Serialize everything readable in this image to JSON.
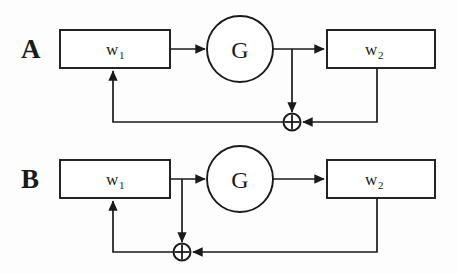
{
  "figure": {
    "background_color": "#fdfdfd",
    "line_color": "#1a1a1a",
    "fill_color": "#ffffff"
  },
  "panels": [
    {
      "id": "A",
      "label": "A",
      "description": "Error signal tapped from the output of the gain block G",
      "blocks": [
        {
          "id": "w1",
          "label": "w",
          "subscript": "1",
          "shape": "rectangle"
        },
        {
          "id": "G",
          "label": "G",
          "subscript": "",
          "shape": "circle"
        },
        {
          "id": "w2",
          "label": "w",
          "subscript": "2",
          "shape": "rectangle"
        }
      ],
      "junction": {
        "id": "sum-a",
        "symbol": "+",
        "shape": "circle-plus"
      },
      "signal_path": [
        "w1 -> G",
        "G -> w2",
        "G -> sum-a (downward tap)",
        "w2 -> sum-a (right feedback)",
        "sum-a -> w1 (left feedback)"
      ]
    },
    {
      "id": "B",
      "label": "B",
      "description": "Error signal tapped from the output of the weight block w1",
      "blocks": [
        {
          "id": "w1",
          "label": "w",
          "subscript": "1",
          "shape": "rectangle"
        },
        {
          "id": "G",
          "label": "G",
          "subscript": "",
          "shape": "circle"
        },
        {
          "id": "w2",
          "label": "w",
          "subscript": "2",
          "shape": "rectangle"
        }
      ],
      "junction": {
        "id": "sum-b",
        "symbol": "+",
        "shape": "circle-plus"
      },
      "signal_path": [
        "w1 -> G",
        "G -> w2",
        "w1 -> sum-b (downward tap)",
        "w2 -> sum-b (right feedback)",
        "sum-b -> w1 (left feedback)"
      ]
    }
  ]
}
